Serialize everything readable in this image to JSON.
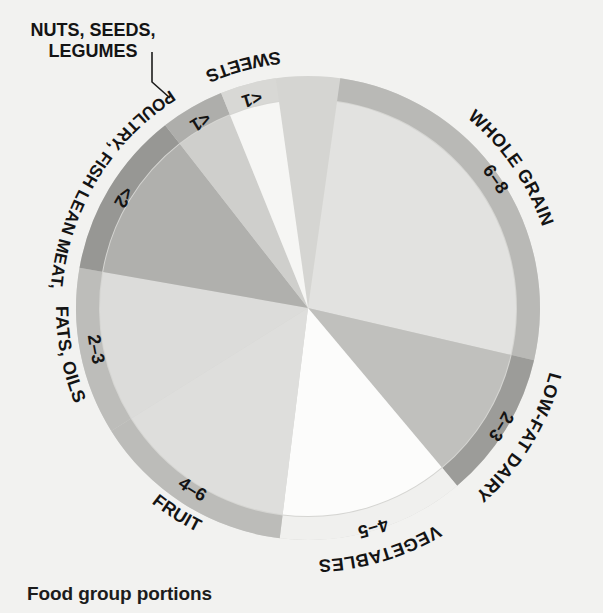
{
  "caption": "Food group portions",
  "chart_data": {
    "type": "pie",
    "title": "Food group portions",
    "xlabel": "",
    "ylabel": "",
    "legend_position": "around-ring",
    "grid": false,
    "units": "portions per day",
    "categories": [
      "WHOLE GRAIN",
      "LOW-FAT DAIRY",
      "VEGETABLES",
      "FRUIT",
      "FATS, OILS",
      "POULTRY, FISH LEAN MEAT,",
      "NUTS, SEEDS, LEGUMES",
      "SWEETS"
    ],
    "value_labels": [
      "6–8",
      "2–3",
      "4–5",
      "4–6",
      "2–3",
      "<2",
      "<1",
      "<1"
    ],
    "values": [
      7,
      2.5,
      4.5,
      5,
      2.5,
      1.5,
      0.7,
      0.7
    ],
    "slices": [
      {
        "name": "WHOLE GRAIN",
        "label": "WHOLE GRAIN",
        "portions": "6–8",
        "value": 7,
        "start_angle": 8,
        "end_angle": 103,
        "slice_color": "#e2e2e0",
        "ring_color": "#b9b9b6",
        "text_radius": 248,
        "value_radius": 222,
        "flip": false
      },
      {
        "name": "LOW-FAT DAIRY",
        "label": "LOW-FAT DAIRY",
        "portions": "2–3",
        "value": 2.5,
        "start_angle": 103,
        "end_angle": 140,
        "slice_color": "#c0c0bd",
        "ring_color": "#9c9c99",
        "text_radius": 250,
        "value_radius": 221,
        "flip": false
      },
      {
        "name": "VEGETABLES",
        "label": "VEGETABLES",
        "portions": "4–5",
        "value": 4.5,
        "start_angle": 140,
        "end_angle": 187,
        "slice_color": "#fcfcfb",
        "ring_color": "#f0f0ee",
        "text_radius": 252,
        "value_radius": 224,
        "flip": false
      },
      {
        "name": "FRUIT",
        "label": "FRUIT",
        "portions": "4–6",
        "value": 5,
        "start_angle": 187,
        "end_angle": 238,
        "slice_color": "#dededc",
        "ring_color": "#bcbcb9",
        "text_radius": 250,
        "value_radius": 221,
        "flip": true
      },
      {
        "name": "FATS, OILS",
        "label": "FATS, OILS",
        "portions": "2–3",
        "value": 2.5,
        "start_angle": 238,
        "end_angle": 280,
        "slice_color": "#dcdcda",
        "ring_color": "#bdbdba",
        "text_radius": 252,
        "value_radius": 222,
        "flip": true
      },
      {
        "name": "POULTRY, FISH LEAN MEAT,",
        "label": "POULTRY, FISH LEAN MEAT,",
        "portions": "<2",
        "value": 1.5,
        "start_angle": 280,
        "end_angle": 322,
        "slice_color": "#b0b0ad",
        "ring_color": "#979794",
        "text_radius": 258,
        "value_radius": 221,
        "flip": true
      },
      {
        "name": "NUTS, SEEDS, LEGUMES",
        "label": "NUTS, SEEDS, LEGUMES",
        "portions": "<1",
        "value": 0.7,
        "start_angle": 322,
        "end_angle": 338,
        "slice_color": "#cfcfcc",
        "ring_color": "#aeaeab",
        "text_radius": 258,
        "value_radius": 221,
        "flip": true
      },
      {
        "name": "SWEETS",
        "label": "SWEETS",
        "portions": "<1",
        "value": 0.7,
        "start_angle": 338,
        "end_angle": 352,
        "slice_color": "#f6f6f4",
        "ring_color": "#d8d8d5",
        "text_radius": 258,
        "value_radius": 222,
        "flip": true
      }
    ]
  },
  "geometry": {
    "cx": 308,
    "cy": 308,
    "slice_radius": 208,
    "ring_inner": 209,
    "ring_outer": 232
  },
  "callout": {
    "label": "NUTS, SEEDS, LEGUMES",
    "line_from": [
      152,
      52
    ],
    "line_to": [
      170,
      98
    ]
  },
  "colors": {
    "background": "#f2f2f0",
    "text": "#141414",
    "callout_line": "#1c1c1c"
  }
}
